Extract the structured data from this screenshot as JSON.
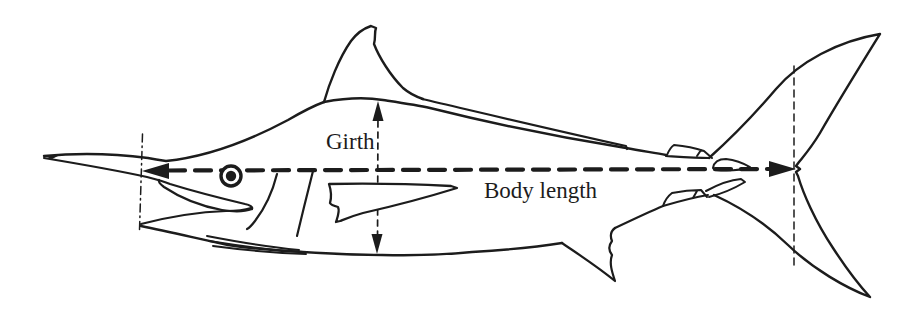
{
  "figure": {
    "type": "measurement-diagram",
    "labels": {
      "girth": "Girth",
      "body_length": "Body length"
    },
    "annotations": {
      "girth_arrow": "vertical double-headed dashed arrow from back to belly",
      "body_length_arrow": "horizontal double-headed dashed arrow from mouth to tail fork",
      "left_reference_line": "vertical dash-dot line at bill base",
      "right_reference_line": "vertical dashed line at tail fork"
    },
    "colors": {
      "ink": "#1c1c1c",
      "background": "#ffffff"
    }
  }
}
